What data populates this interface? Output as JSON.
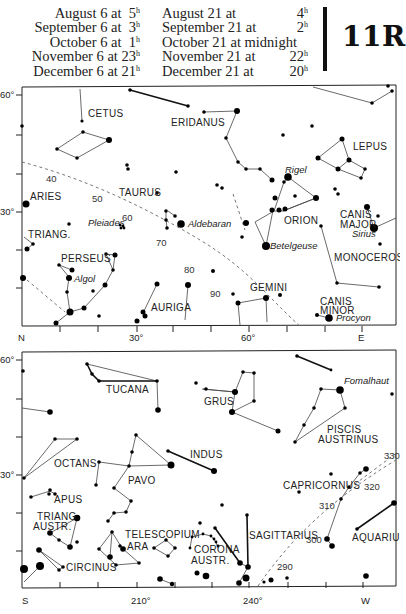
{
  "header": {
    "times_left": [
      {
        "label": "August 6 at",
        "hour": "5",
        "unit": "h"
      },
      {
        "label": "September 6 at",
        "hour": "3",
        "unit": "h"
      },
      {
        "label": "October 6 at",
        "hour": "1",
        "unit": "h"
      },
      {
        "label": "November 6 at",
        "hour": "23",
        "unit": "h"
      },
      {
        "label": "December 6 at",
        "hour": "21",
        "unit": "h"
      }
    ],
    "times_right": [
      {
        "label": "August 21 at",
        "hour": "4",
        "unit": "h"
      },
      {
        "label": "September 21 at",
        "hour": "2",
        "unit": "h"
      },
      {
        "label": "October 21 at midnight",
        "hour": "",
        "unit": ""
      },
      {
        "label": "November 21 at",
        "hour": "22",
        "unit": "h"
      },
      {
        "label": "December 21 at",
        "hour": "20",
        "unit": "h"
      }
    ],
    "plate_id": "11R"
  },
  "north_map": {
    "axis": {
      "y_labels": [
        "60°",
        "30°"
      ],
      "x_labels": [
        "N",
        "30°",
        "60°",
        "E"
      ]
    },
    "constellations": [
      "CETUS",
      "ERIDANUS",
      "LEPUS",
      "ARIES",
      "TAURUS",
      "ORION",
      "CANIS MAJOR",
      "TRIANG.",
      "PERSEUS",
      "MONOCEROS",
      "GEMINI",
      "AURIGA",
      "CANIS MINOR"
    ],
    "labels": {
      "cetus": "CETUS",
      "eridanus": "ERIDANUS",
      "lepus": "LEPUS",
      "aries": "ARIES",
      "taurus": "TAURUS",
      "orion": "ORION",
      "canis_major_1": "CANIS",
      "canis_major_2": "MAJOR",
      "triang": "TRIANG.",
      "perseus": "PERSEUS",
      "monoceros": "MONOCEROS",
      "gemini": "GEMINI",
      "auriga": "AURIGA",
      "canis_minor_1": "CANIS",
      "canis_minor_2": "MINOR"
    },
    "stars": {
      "rigel": "Rigel",
      "sirius": "Sirius",
      "pleiades": "Pleiades",
      "aldebaran": "Aldebaran",
      "betelgeuse": "Betelgeuse",
      "algol": "Algol",
      "procyon": "Procyon"
    },
    "ecliptic_marks": [
      "40",
      "50",
      "60",
      "70",
      "80",
      "90"
    ]
  },
  "south_map": {
    "axis": {
      "y_labels": [
        "60°",
        "30°"
      ],
      "x_labels": [
        "S",
        "210°",
        "240°",
        "W"
      ]
    },
    "labels": {
      "tucana": "TUCANA",
      "grus": "GRUS",
      "piscis_1": "PISCIS",
      "piscis_2": "AUSTRINUS",
      "octans": "OCTANS",
      "indus": "INDUS",
      "pavo": "PAVO",
      "apus": "APUS",
      "triang_1": "TRIANG",
      "triang_2": "AUSTR.",
      "capricornus": "CAPRICORNUS",
      "telescopium": "TELESCOPIUM",
      "ara": "ARA",
      "corona_1": "CORONA",
      "corona_2": "AUSTR.",
      "sagittarius": "SAGITTARIUS",
      "aquarius": "AQUARIUS",
      "circinus": "CIRCINUS"
    },
    "stars": {
      "fomalhaut": "Fomalhaut"
    },
    "ecliptic_marks": [
      "290",
      "300",
      "310",
      "320",
      "330"
    ]
  }
}
